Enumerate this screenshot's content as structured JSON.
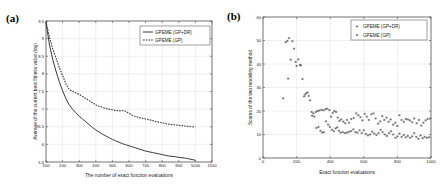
{
  "figure": {
    "panels": [
      {
        "tag": "(a)",
        "name": "convergence-curve-panel",
        "legend": [
          {
            "label": "GPEME (GP+DR)",
            "style": "solid"
          },
          {
            "label": "GPEME (GP)",
            "style": "dashed"
          }
        ]
      },
      {
        "tag": "(b)",
        "name": "modeling-scores-scatter-panel",
        "legend": [
          {
            "label": "GPEME (GP+DR)",
            "style": "marker"
          },
          {
            "label": "GPEME (GP)",
            "style": "marker"
          }
        ]
      }
    ]
  },
  "chart_data": [
    {
      "type": "line",
      "panel": "(a)",
      "title": "",
      "xlabel": "The number of exact function evaluations",
      "ylabel": "Average of the current best fitness value (log)",
      "xlim": [
        100,
        1100
      ],
      "ylim": [
        5.5,
        9.5
      ],
      "xticks": [
        100,
        200,
        300,
        400,
        500,
        600,
        700,
        800,
        900,
        1000,
        1100
      ],
      "yticks": [
        5.5,
        6,
        6.5,
        7,
        7.5,
        8,
        8.5,
        9,
        9.5
      ],
      "grid": true,
      "legend_position": "top-right",
      "x": [
        100,
        120,
        140,
        160,
        180,
        200,
        220,
        240,
        260,
        280,
        300,
        320,
        340,
        360,
        380,
        400,
        420,
        440,
        460,
        480,
        500,
        520,
        540,
        560,
        580,
        600,
        620,
        640,
        660,
        680,
        700,
        720,
        740,
        760,
        780,
        800,
        820,
        840,
        860,
        880,
        900,
        920,
        940,
        960,
        980,
        1000
      ],
      "series": [
        {
          "name": "GPEME (GP+DR)",
          "style": "solid",
          "values": [
            9.45,
            8.85,
            8.42,
            8.08,
            7.78,
            7.52,
            7.3,
            7.12,
            7.0,
            6.9,
            6.8,
            6.72,
            6.64,
            6.56,
            6.48,
            6.41,
            6.35,
            6.29,
            6.24,
            6.19,
            6.14,
            6.1,
            6.06,
            6.02,
            5.99,
            5.96,
            5.93,
            5.9,
            5.87,
            5.84,
            5.81,
            5.79,
            5.77,
            5.75,
            5.73,
            5.71,
            5.69,
            5.67,
            5.66,
            5.65,
            5.63,
            5.62,
            5.61,
            5.59,
            5.57,
            5.55
          ]
        },
        {
          "name": "GPEME (GP)",
          "style": "dashed",
          "values": [
            9.48,
            9.05,
            8.72,
            8.45,
            8.18,
            7.95,
            7.72,
            7.56,
            7.5,
            7.46,
            7.42,
            7.36,
            7.3,
            7.24,
            7.18,
            7.12,
            7.08,
            7.05,
            7.02,
            7.0,
            6.98,
            6.96,
            6.95,
            6.96,
            6.94,
            6.88,
            6.83,
            6.79,
            6.76,
            6.74,
            6.72,
            6.7,
            6.68,
            6.65,
            6.63,
            6.61,
            6.59,
            6.57,
            6.56,
            6.55,
            6.54,
            6.53,
            6.52,
            6.51,
            6.5,
            6.49
          ]
        }
      ]
    },
    {
      "type": "scatter",
      "panel": "(b)",
      "title": "",
      "xlabel": "Exact function evaluations",
      "ylabel": "Scores of the two modeling method",
      "xlim": [
        0,
        1000
      ],
      "ylim": [
        0,
        60
      ],
      "xticks": [
        0,
        200,
        400,
        600,
        800,
        1000
      ],
      "yticks": [
        0,
        10,
        20,
        30,
        40,
        50,
        60
      ],
      "grid": true,
      "legend_position": "top-right",
      "series": [
        {
          "name": "GPEME (GP+DR)",
          "points": [
            [
              120,
              25.4
            ],
            [
              135,
              49.3
            ],
            [
              145,
              49.8
            ],
            [
              155,
              51.0
            ],
            [
              165,
              41.8
            ],
            [
              150,
              33.8
            ],
            [
              175,
              49.7
            ],
            [
              185,
              46.5
            ],
            [
              195,
              40.9
            ],
            [
              200,
              39.2
            ],
            [
              210,
              42.0
            ],
            [
              220,
              39.6
            ],
            [
              225,
              39.4
            ],
            [
              235,
              33.6
            ],
            [
              245,
              26.2
            ],
            [
              250,
              27.0
            ],
            [
              258,
              27.6
            ],
            [
              265,
              27.9
            ],
            [
              272,
              26.4
            ],
            [
              280,
              24.5
            ],
            [
              290,
              19.6
            ],
            [
              300,
              19.0
            ],
            [
              315,
              19.6
            ],
            [
              325,
              20.0
            ],
            [
              335,
              20.2
            ],
            [
              348,
              20.5
            ],
            [
              360,
              20.3
            ],
            [
              372,
              20.8
            ],
            [
              382,
              21.0
            ],
            [
              395,
              20.4
            ],
            [
              405,
              17.6
            ],
            [
              415,
              19.2
            ],
            [
              425,
              20.0
            ],
            [
              435,
              19.6
            ],
            [
              445,
              17.2
            ],
            [
              455,
              15.8
            ],
            [
              465,
              16.4
            ],
            [
              478,
              15.5
            ],
            [
              490,
              14.8
            ],
            [
              500,
              16.2
            ],
            [
              512,
              15.0
            ],
            [
              525,
              16.6
            ],
            [
              540,
              17.0
            ],
            [
              555,
              19.0
            ],
            [
              568,
              18.2
            ],
            [
              580,
              17.4
            ],
            [
              592,
              16.0
            ],
            [
              605,
              18.8
            ],
            [
              618,
              17.6
            ],
            [
              630,
              16.2
            ],
            [
              645,
              18.6
            ],
            [
              658,
              19.0
            ],
            [
              670,
              16.8
            ],
            [
              685,
              14.6
            ],
            [
              698,
              15.6
            ],
            [
              710,
              17.8
            ],
            [
              722,
              16.2
            ],
            [
              735,
              17.2
            ],
            [
              748,
              15.4
            ],
            [
              760,
              16.4
            ],
            [
              775,
              14.2
            ],
            [
              788,
              15.0
            ],
            [
              800,
              13.6
            ],
            [
              812,
              18.2
            ],
            [
              825,
              16.2
            ],
            [
              838,
              15.4
            ],
            [
              850,
              16.6
            ],
            [
              862,
              16.4
            ],
            [
              875,
              16.0
            ],
            [
              888,
              15.2
            ],
            [
              900,
              16.8
            ],
            [
              915,
              14.8
            ],
            [
              928,
              16.2
            ],
            [
              942,
              13.8
            ],
            [
              955,
              15.0
            ],
            [
              968,
              16.0
            ],
            [
              980,
              16.6
            ],
            [
              995,
              16.8
            ]
          ]
        },
        {
          "name": "GPEME (GP)",
          "points": [
            [
              292,
              18.0
            ],
            [
              305,
              17.6
            ],
            [
              318,
              12.8
            ],
            [
              330,
              13.2
            ],
            [
              342,
              11.6
            ],
            [
              352,
              10.8
            ],
            [
              362,
              11.0
            ],
            [
              375,
              15.6
            ],
            [
              388,
              14.2
            ],
            [
              398,
              13.2
            ],
            [
              410,
              12.0
            ],
            [
              422,
              11.4
            ],
            [
              432,
              12.6
            ],
            [
              442,
              13.0
            ],
            [
              452,
              11.6
            ],
            [
              462,
              10.8
            ],
            [
              475,
              11.0
            ],
            [
              488,
              10.6
            ],
            [
              500,
              10.8
            ],
            [
              512,
              11.2
            ],
            [
              525,
              11.4
            ],
            [
              538,
              12.2
            ],
            [
              550,
              11.0
            ],
            [
              562,
              10.8
            ],
            [
              575,
              11.8
            ],
            [
              588,
              10.6
            ],
            [
              600,
              11.8
            ],
            [
              612,
              10.2
            ],
            [
              625,
              9.6
            ],
            [
              638,
              10.0
            ],
            [
              650,
              11.2
            ],
            [
              662,
              10.4
            ],
            [
              675,
              9.8
            ],
            [
              688,
              10.6
            ],
            [
              700,
              12.0
            ],
            [
              712,
              11.0
            ],
            [
              725,
              10.0
            ],
            [
              738,
              9.4
            ],
            [
              750,
              10.6
            ],
            [
              762,
              11.4
            ],
            [
              775,
              10.0
            ],
            [
              788,
              8.6
            ],
            [
              800,
              9.2
            ],
            [
              812,
              10.4
            ],
            [
              825,
              9.0
            ],
            [
              838,
              9.8
            ],
            [
              850,
              8.8
            ],
            [
              862,
              9.4
            ],
            [
              875,
              8.6
            ],
            [
              888,
              9.2
            ],
            [
              900,
              10.6
            ],
            [
              912,
              9.0
            ],
            [
              925,
              8.2
            ],
            [
              938,
              9.6
            ],
            [
              950,
              8.4
            ],
            [
              962,
              9.0
            ],
            [
              975,
              8.6
            ],
            [
              988,
              8.8
            ]
          ]
        }
      ]
    }
  ]
}
